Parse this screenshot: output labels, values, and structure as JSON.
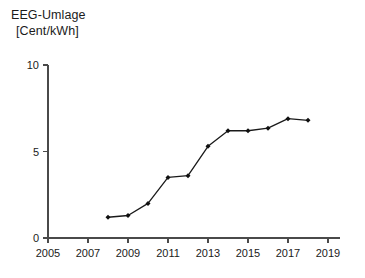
{
  "chart_data": {
    "type": "line",
    "title": "EEG-Umlage",
    "subtitle": "[Cent/kWh]",
    "xlabel": "",
    "ylabel": "",
    "x": [
      2008,
      2009,
      2010,
      2011,
      2012,
      2013,
      2014,
      2015,
      2016,
      2017,
      2018
    ],
    "values": [
      1.2,
      1.3,
      2.0,
      3.5,
      3.6,
      5.3,
      6.2,
      6.2,
      6.35,
      6.9,
      6.8
    ],
    "series": [
      {
        "name": "EEG-Umlage",
        "values": [
          1.2,
          1.3,
          2.0,
          3.5,
          3.6,
          5.3,
          6.2,
          6.2,
          6.35,
          6.9,
          6.8
        ]
      }
    ],
    "xlim": [
      2005,
      2019.6
    ],
    "ylim": [
      0,
      10
    ],
    "xticks": [
      2005,
      2007,
      2009,
      2011,
      2013,
      2015,
      2017,
      2019
    ],
    "xtick_labels": [
      "2005",
      "2007",
      "2009",
      "2011",
      "2013",
      "2015",
      "2017",
      "2019"
    ],
    "yticks": [
      0,
      5,
      10
    ],
    "ytick_labels": [
      "0",
      "5",
      "10"
    ],
    "grid": false,
    "legend": false,
    "legend_position": "none",
    "marker": "filled-diamond",
    "line_color": "#1a1a1a",
    "marker_color": "#101010",
    "axis_color": "#4a4a4a",
    "background_color": "#ffffff"
  }
}
